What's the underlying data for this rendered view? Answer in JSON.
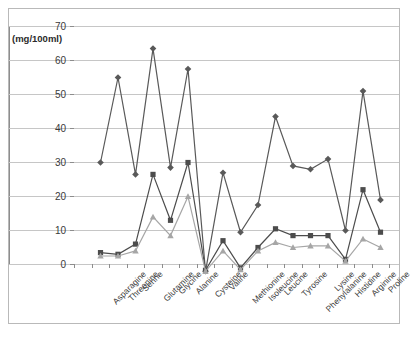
{
  "chart_data": {
    "type": "line",
    "title": "",
    "xlabel": "",
    "ylabel": "(mg/100ml)",
    "ylim": [
      0,
      70
    ],
    "yticks": [
      0,
      10,
      20,
      30,
      40,
      50,
      60,
      70
    ],
    "grid": true,
    "legend": "none",
    "categories": [
      "Asparagine",
      "Threonine",
      "Serine",
      "Glutamine",
      "Glycine",
      "Alanine",
      "Cysteine",
      "Valine",
      "Methionine",
      "Isoleucine",
      "Leucine",
      "Tyrosine",
      "Phenylalanine",
      "Lysine",
      "Histidine",
      "Arginine",
      "Proline"
    ],
    "series": [
      {
        "name": "series-1-diamond",
        "marker": "diamond",
        "color": "#595959",
        "values": [
          32.5,
          57.5,
          29.0,
          66.0,
          31.0,
          60.0,
          0.5,
          29.5,
          12.0,
          20.0,
          46.0,
          31.5,
          30.5,
          33.5,
          12.5,
          53.5,
          21.5
        ]
      },
      {
        "name": "series-2-square",
        "marker": "square",
        "color": "#4c4c4c",
        "values": [
          6.0,
          5.5,
          8.5,
          29.0,
          15.5,
          32.5,
          0.8,
          9.5,
          1.5,
          7.5,
          13.0,
          11.0,
          11.0,
          11.0,
          4.0,
          24.5,
          12.0
        ]
      },
      {
        "name": "series-3-triangle",
        "marker": "triangle",
        "color": "#a6a6a6",
        "values": [
          5.0,
          5.0,
          6.5,
          16.5,
          11.0,
          22.5,
          0.5,
          6.5,
          1.0,
          6.5,
          9.0,
          7.5,
          8.0,
          8.0,
          3.5,
          10.0,
          7.5
        ]
      }
    ]
  },
  "axis": {
    "y_unit_label": "(mg/100ml)"
  }
}
